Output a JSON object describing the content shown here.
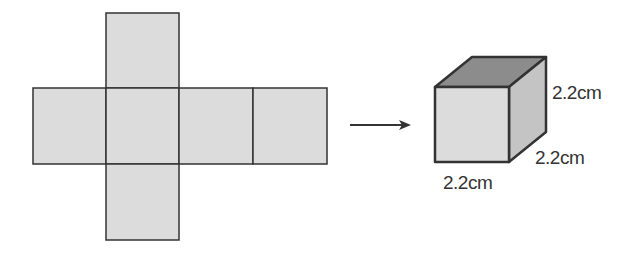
{
  "diagram": {
    "net": {
      "faces": 6,
      "layout": "cross: one face above, row of four, one face below (second column)"
    },
    "arrow": "right-arrow",
    "cube": {
      "edge_labels": {
        "height": "2.2cm",
        "depth": "2.2cm",
        "width": "2.2cm"
      }
    },
    "colors": {
      "face_fill": "#dcdcdc",
      "top_face_fill": "#8c8c8c",
      "side_face_fill": "#c4c4c4",
      "stroke": "#333333"
    }
  }
}
